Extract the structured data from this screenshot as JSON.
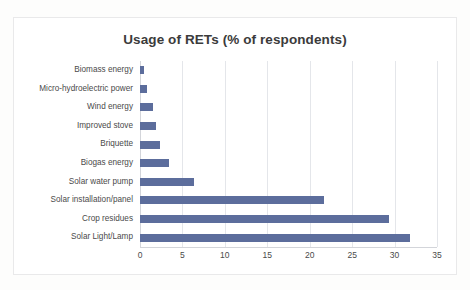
{
  "chart_data": {
    "type": "bar",
    "orientation": "horizontal",
    "title": "Usage of RETs (% of respondents)",
    "xlabel": "",
    "ylabel": "",
    "categories": [
      "Biomass energy",
      "Micro-hydroelectric power",
      "Wind energy",
      "Improved stove",
      "Briquette",
      "Biogas energy",
      "Solar water pump",
      "Solar installation/panel",
      "Crop residues",
      "Solar Light/Lamp"
    ],
    "values": [
      0.5,
      0.8,
      1.5,
      1.9,
      2.4,
      3.4,
      6.4,
      21.7,
      29.4,
      31.8
    ],
    "xticks": [
      0,
      5,
      10,
      15,
      20,
      25,
      30,
      35
    ],
    "xlim": [
      0,
      35
    ],
    "grid": "vertical",
    "legend": "none",
    "bar_color": "#5c6d9c",
    "gridline_color": "#e4e6ea",
    "axis_color": "#d3d5da",
    "title_color": "#3b3b3b",
    "label_color": "#4a4a4a"
  }
}
